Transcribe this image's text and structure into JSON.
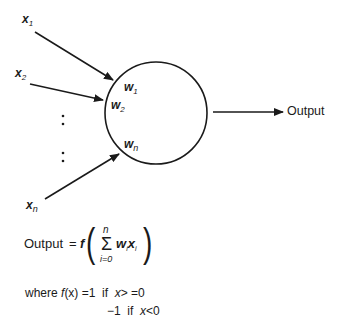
{
  "diagram": {
    "type": "perceptron",
    "inputs": [
      {
        "label": "x",
        "sub": "1"
      },
      {
        "label": "x",
        "sub": "2"
      },
      {
        "label": "x",
        "sub": "n"
      }
    ],
    "ellipsis": ":",
    "weights": [
      {
        "label": "w",
        "sub": "1"
      },
      {
        "label": "w",
        "sub": "2"
      },
      {
        "label": "w",
        "sub": "n"
      }
    ],
    "output_label": "Output",
    "colors": {
      "stroke": "#1a1a1a",
      "background": "#ffffff"
    }
  },
  "formula": {
    "lhs": "Output",
    "equals": "=",
    "func": "f",
    "open_paren": "(",
    "close_paren": ")",
    "sigma": "Σ",
    "upper": "n",
    "lower": "i=0",
    "term_w": "w",
    "term_x": "x",
    "term_sub": "i"
  },
  "definition": {
    "line1_prefix": "where",
    "line1_func": "f",
    "line1_arg": "(x)",
    "line1_value": "=1",
    "line1_if": "if",
    "line1_cond_var": "x",
    "line1_cond": "> =0",
    "line2_value": "−1",
    "line2_if": "if",
    "line2_cond_var": "x",
    "line2_cond": "<0"
  }
}
